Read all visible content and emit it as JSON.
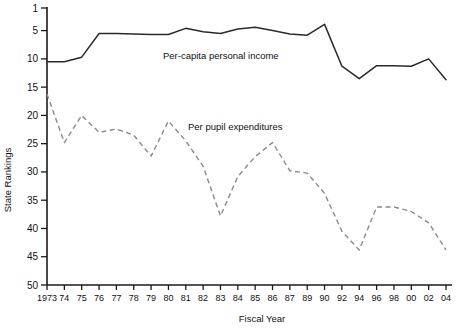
{
  "chart_data": {
    "type": "line",
    "title": "",
    "xlabel": "Fiscal Year",
    "ylabel": "State Rankings",
    "grid": false,
    "legend_position": "inline-annotation",
    "y_inverted": true,
    "ylim": [
      1,
      50
    ],
    "yticks": [
      1,
      5,
      10,
      15,
      20,
      25,
      30,
      35,
      40,
      45,
      50
    ],
    "ytick_labels": [
      "1",
      "5",
      "10",
      "15",
      "20",
      "25",
      "30",
      "35",
      "40",
      "45",
      "50"
    ],
    "x": [
      "1973",
      "74",
      "75",
      "76",
      "77",
      "78",
      "79",
      "80",
      "81",
      "82",
      "83",
      "84",
      "85",
      "86",
      "87",
      "89",
      "90",
      "92",
      "94",
      "96",
      "98",
      "00",
      "02",
      "04"
    ],
    "series": [
      {
        "name": "Per-capita personal income",
        "style": "solid",
        "color": "#2a2a2a",
        "label_x": 163,
        "label_y": 59,
        "values": [
          10.5,
          10.5,
          9.7,
          5.5,
          5.5,
          5.6,
          5.7,
          5.7,
          4.6,
          5.2,
          5.5,
          4.7,
          4.4,
          5.0,
          5.6,
          5.8,
          3.9,
          11.3,
          13.5,
          11.2,
          11.2,
          11.3,
          10.0,
          13.7
        ]
      },
      {
        "name": "Per pupil expenditures",
        "style": "dashed",
        "color": "#8a8a8a",
        "label_x": 188,
        "label_y": 130,
        "values": [
          16.2,
          24.8,
          20.0,
          23.0,
          22.4,
          23.5,
          27.2,
          21.0,
          24.5,
          29.0,
          37.8,
          30.8,
          27.3,
          24.8,
          29.8,
          30.2,
          33.8,
          40.5,
          43.8,
          36.2,
          36.2,
          37.0,
          39.0,
          43.8
        ]
      }
    ]
  }
}
